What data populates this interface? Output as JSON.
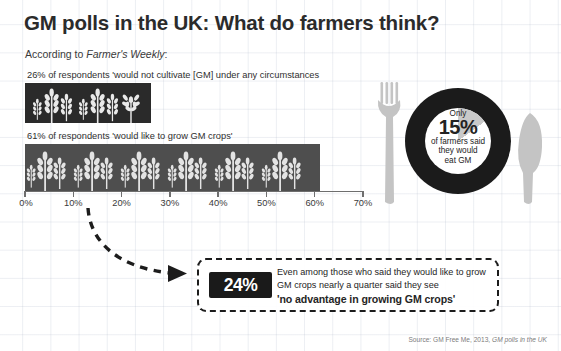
{
  "header": {
    "title": "GM polls in the UK: What do farmers think?",
    "subtitle_prefix": "According to ",
    "subtitle_italic": "Farmer's Weekly",
    "subtitle_suffix": ":"
  },
  "chart_data": {
    "type": "bar",
    "orientation": "horizontal",
    "title": "GM polls in the UK: What do farmers think?",
    "categories": [
      "26% of respondents 'would not cultivate [GM] under any circumstances",
      "61% of respondents 'would like to grow GM crops'"
    ],
    "values": [
      26,
      61
    ],
    "xlabel": "",
    "ylabel": "",
    "xlim": [
      0,
      70
    ],
    "xticks": [
      0,
      10,
      20,
      30,
      40,
      50,
      60,
      70
    ],
    "xtick_labels": [
      "0%",
      "10%",
      "20%",
      "30%",
      "40%",
      "50%",
      "60%",
      "70%"
    ],
    "grid": false,
    "legend": "none",
    "series_colors": [
      "#2a2a2a",
      "#4e4e4e"
    ],
    "bar_icons": [
      "wheat-crossed",
      "wheat"
    ]
  },
  "plate": {
    "only_label": "Only",
    "percent": "15%",
    "caption_line1": "of farmers said",
    "caption_line2": "they would",
    "caption_line3": "eat GM",
    "slice_value": 15,
    "donut_color": "#1b1b1b",
    "slice_color": "#c9c9c9",
    "cutlery_color": "#c2c2c2"
  },
  "callout": {
    "percent": "24%",
    "line1": "Even among those who said they would like to",
    "line2": "grow GM crops nearly a quarter said they see",
    "emphasis": "'no advantage in growing GM crops'"
  },
  "source": {
    "prefix": "Source: GM Free Me, 2013, ",
    "italic": "GM polls in the UK"
  },
  "icons": {
    "fork": "fork-icon",
    "knife": "knife-icon",
    "arrow": "curved-dashed-arrow-icon",
    "wheat": "wheat-icon",
    "wheat_crossed": "wheat-crossed-icon"
  }
}
